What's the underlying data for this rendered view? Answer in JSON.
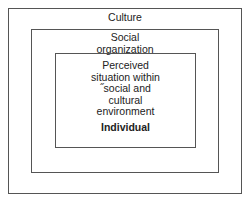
{
  "diagram": {
    "type": "nested-boxes",
    "levels": [
      {
        "id": "culture",
        "label": "Culture"
      },
      {
        "id": "social-organization",
        "label": "Social organization",
        "lines": [
          "Social",
          "organization"
        ]
      },
      {
        "id": "individual",
        "label": "Individual",
        "description_lines": [
          "Perceived",
          "situation within",
          "˝social and",
          "cultural",
          "environment"
        ],
        "title": "Individual"
      }
    ]
  }
}
